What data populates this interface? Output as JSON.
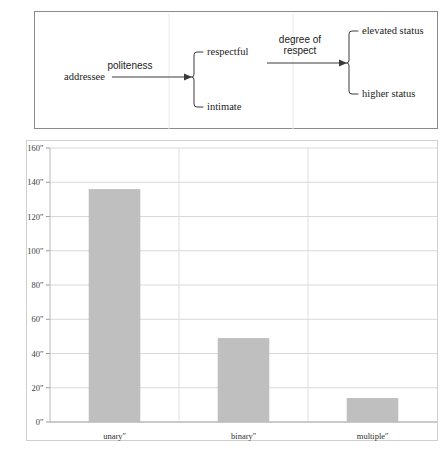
{
  "diagram": {
    "name": "politeness-feature-diagram",
    "nodes": [
      {
        "id": "addressee",
        "label": "addressee"
      },
      {
        "id": "respectful",
        "label": "respectful"
      },
      {
        "id": "intimate",
        "label": "intimate"
      },
      {
        "id": "elevated_status",
        "label": "elevated status"
      },
      {
        "id": "higher_status",
        "label": "higher status"
      }
    ],
    "edges": [
      {
        "id": "edge1",
        "label": "politeness",
        "from": "addressee",
        "to": "respectful-intimate-bracket"
      },
      {
        "id": "edge2",
        "label_line1": "degree of",
        "label_line2": "respect",
        "from": "respectful",
        "to": "status-bracket"
      }
    ],
    "border_color": "#8a8a8a",
    "line_color": "#3a3a3a"
  },
  "chart_data": {
    "type": "bar",
    "title": "",
    "xlabel": "",
    "ylabel": "",
    "categories": [
      "unaryʺ",
      "binaryʺ",
      "multipleʺ"
    ],
    "values": [
      136,
      49,
      14
    ],
    "ylim": [
      0,
      160
    ],
    "yticks": [
      0,
      20,
      40,
      60,
      80,
      100,
      120,
      140,
      160
    ],
    "ytick_labels": [
      "0ʺ",
      "20ʺ",
      "40ʺ",
      "60ʺ",
      "80ʺ",
      "100ʺ",
      "120ʺ",
      "140ʺ",
      "160ʺ"
    ],
    "grid": true,
    "grid_axis": "both",
    "legend": false,
    "bar_color": "#bfbfbf",
    "grid_color": "#d8d8d8"
  }
}
